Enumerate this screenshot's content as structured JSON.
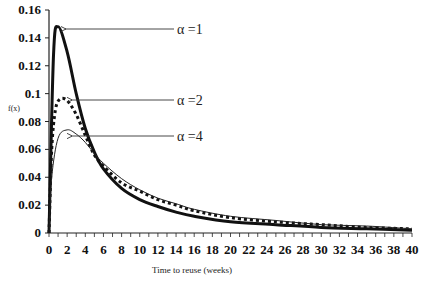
{
  "chart_data": {
    "type": "line",
    "title": "",
    "xlabel": "Time to reuse (weeks)",
    "ylabel": "f(x)",
    "xlim": [
      0,
      40
    ],
    "ylim": [
      0,
      0.16
    ],
    "xticks": [
      0,
      2,
      4,
      6,
      8,
      10,
      12,
      14,
      16,
      18,
      20,
      22,
      24,
      26,
      28,
      30,
      32,
      34,
      36,
      38,
      40
    ],
    "yticks": [
      0,
      0.02,
      0.04,
      0.06,
      0.08,
      0.1,
      0.12,
      0.14,
      0.16
    ],
    "ytick_labels": [
      "0",
      "0.02",
      "0.04",
      "0.06",
      "0.08",
      "0.1",
      "0.12",
      "0.14",
      "0.16"
    ],
    "grid": false,
    "legend": "annotations with arrows",
    "series": [
      {
        "name": "α =1",
        "style": "thick-solid",
        "x": [
          0,
          0.5,
          1,
          2,
          3,
          4,
          5,
          6,
          8,
          10,
          12,
          14,
          16,
          20,
          25,
          30,
          35,
          40
        ],
        "y": [
          0,
          0.128,
          0.148,
          0.13,
          0.1,
          0.075,
          0.058,
          0.046,
          0.032,
          0.024,
          0.019,
          0.015,
          0.012,
          0.008,
          0.006,
          0.004,
          0.003,
          0.002
        ],
        "peak": {
          "x": 1,
          "y": 0.148
        }
      },
      {
        "name": "α =2",
        "style": "thick-dotted",
        "x": [
          0,
          0.3,
          0.7,
          1.2,
          2,
          3,
          4,
          5,
          6,
          8,
          10,
          12,
          14,
          16,
          20,
          25,
          30,
          35,
          40
        ],
        "y": [
          0,
          0.06,
          0.088,
          0.096,
          0.095,
          0.085,
          0.07,
          0.056,
          0.048,
          0.036,
          0.03,
          0.024,
          0.02,
          0.016,
          0.011,
          0.008,
          0.006,
          0.004,
          0.003
        ],
        "peak": {
          "x": 1.5,
          "y": 0.096
        }
      },
      {
        "name": "α =4",
        "style": "thin-solid",
        "x": [
          0,
          0.3,
          1,
          2,
          3,
          4,
          5,
          6,
          8,
          10,
          12,
          14,
          16,
          20,
          25,
          30,
          35,
          40
        ],
        "y": [
          0,
          0.04,
          0.068,
          0.074,
          0.071,
          0.065,
          0.057,
          0.05,
          0.039,
          0.031,
          0.025,
          0.021,
          0.017,
          0.012,
          0.009,
          0.006,
          0.005,
          0.003
        ],
        "peak": {
          "x": 2,
          "y": 0.074
        }
      }
    ],
    "annotations": [
      {
        "text": "α =1",
        "arrow_to": {
          "x": 1,
          "y": 0.148
        }
      },
      {
        "text": "α =2",
        "arrow_to": {
          "x": 1.7,
          "y": 0.096
        }
      },
      {
        "text": "α =4",
        "arrow_to": {
          "x": 1.7,
          "y": 0.07
        }
      }
    ]
  }
}
